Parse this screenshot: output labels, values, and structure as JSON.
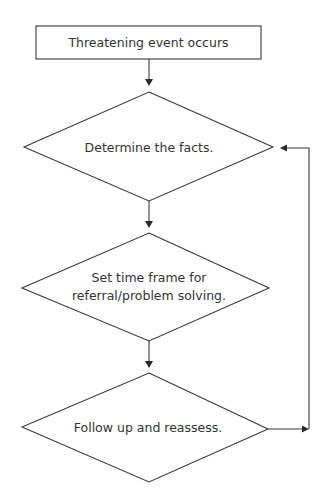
{
  "diagram": {
    "type": "flowchart",
    "stroke_color": "#3a3a3a",
    "text_color": "#333333",
    "background": "#ffffff",
    "nodes": [
      {
        "id": "start",
        "shape": "rectangle",
        "lines": [
          "Threatening event occurs"
        ]
      },
      {
        "id": "facts",
        "shape": "diamond",
        "lines": [
          "Determine the facts."
        ]
      },
      {
        "id": "timeframe",
        "shape": "diamond",
        "lines": [
          "Set time frame for",
          "referral/problem solving."
        ]
      },
      {
        "id": "followup",
        "shape": "diamond",
        "lines": [
          "Follow up and reassess."
        ]
      }
    ],
    "edges": [
      {
        "from": "start",
        "to": "facts",
        "direction": "down"
      },
      {
        "from": "facts",
        "to": "timeframe",
        "direction": "down"
      },
      {
        "from": "timeframe",
        "to": "followup",
        "direction": "down"
      },
      {
        "from": "followup",
        "to": "facts",
        "direction": "loop-back-right"
      }
    ]
  }
}
